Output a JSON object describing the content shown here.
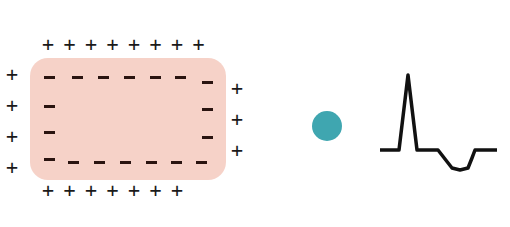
{
  "diagram": {
    "title": "",
    "cell": {
      "fill": "#f6d2c8",
      "outside_charge": "+",
      "inside_charge": "-"
    },
    "plus_top": {
      "symbol": "+",
      "count": 8
    },
    "plus_bottom": {
      "symbol": "+",
      "count": 7
    },
    "plus_left": {
      "symbol": "+",
      "count": 4
    },
    "plus_right": {
      "symbol": "+",
      "count": 3
    },
    "indicator_dot": {
      "color": "#3fa6b0"
    },
    "ecg_trace": {
      "stroke": "#111111",
      "description": "baseline, sharp spike upward, return to baseline, negative rounded dip, baseline"
    }
  }
}
